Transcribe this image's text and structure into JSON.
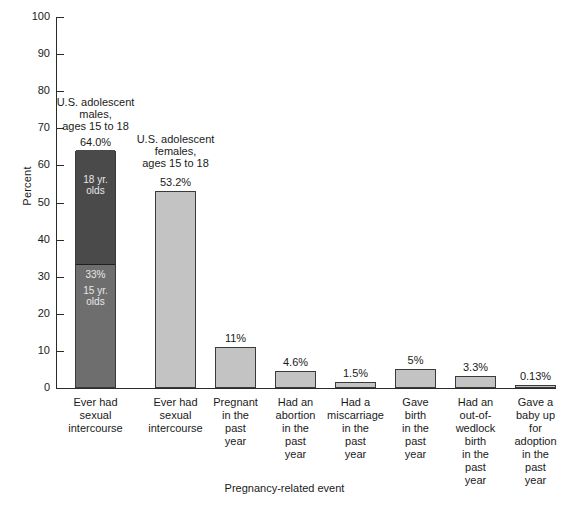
{
  "chart_data": {
    "type": "bar",
    "title": "",
    "xlabel": "Pregnancy-related event",
    "ylabel": "Percent",
    "ylim": [
      0,
      100
    ],
    "ytick_step": 10,
    "yticks": [
      "100",
      "90",
      "80",
      "70",
      "60",
      "50",
      "40",
      "30",
      "20",
      "10",
      "0"
    ],
    "grid": false,
    "legend": "none",
    "categories": [
      "Ever had\nsexual\nintercourse",
      "Ever had\nsexual\nintercourse",
      "Pregnant\nin the\npast\nyear",
      "Had an\nabortion\nin the\npast\nyear",
      "Had a\nmiscarriage\nin the\npast\nyear",
      "Gave\nbirth\nin the\npast\nyear",
      "Had an\nout-of-\nwedlock\nbirth\nin the\npast\nyear",
      "Gave a\nbaby up\nfor\nadoption\nin the\npast\nyear"
    ],
    "values": [
      64.0,
      53.2,
      11,
      4.6,
      1.5,
      5,
      3.3,
      0.13
    ],
    "value_labels": [
      "64.0%",
      "53.2%",
      "11%",
      "4.6%",
      "1.5%",
      "5%",
      "3.3%",
      "0.13%"
    ],
    "group_notes": [
      "U.S. adolescent\nmales,\nages 15 to 18",
      "U.S. adolescent\nfemales,\nages 15 to 18"
    ],
    "stacked_bar": {
      "index": 0,
      "total": 64.0,
      "segments": [
        {
          "label": "18 yr.\nolds",
          "from": 33,
          "to": 64.0,
          "value_label": "",
          "color": "#4a4a4a"
        },
        {
          "label": "15 yr.\nolds",
          "from": 0,
          "to": 33,
          "value_label": "33%",
          "color": "#6e6e6e"
        }
      ]
    },
    "colors": {
      "bar_light": "#c3c3c3",
      "bar_mid": "#6e6e6e",
      "bar_dark": "#4a4a4a",
      "outline": "#3a3a3a",
      "axis": "#2b2b2b",
      "text": "#1a1a1a",
      "seg_text": "#e8e8e8",
      "background": "#ffffff"
    }
  }
}
